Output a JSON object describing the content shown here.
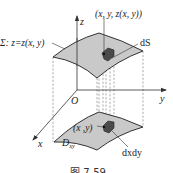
{
  "figure": {
    "caption": "图 7-59",
    "colors": {
      "surface_fill": "#c9c9c9",
      "surface_stroke": "#333333",
      "patch_fill": "#4a4a4a",
      "axis": "#333333",
      "dashed": "#777777",
      "background": "#ffffff"
    }
  },
  "axes": {
    "z_label": "z",
    "y_label": "y",
    "x_label": "x",
    "origin_label": "O"
  },
  "labels": {
    "surface_equation": "Σ: z=z(x, y)",
    "point_on_surface": "(x, y, z(x, y))",
    "surface_element": "dS",
    "point_in_region": "(x ,y)",
    "region_name": "D",
    "region_subscript": "xy",
    "area_element": "dxdy"
  }
}
